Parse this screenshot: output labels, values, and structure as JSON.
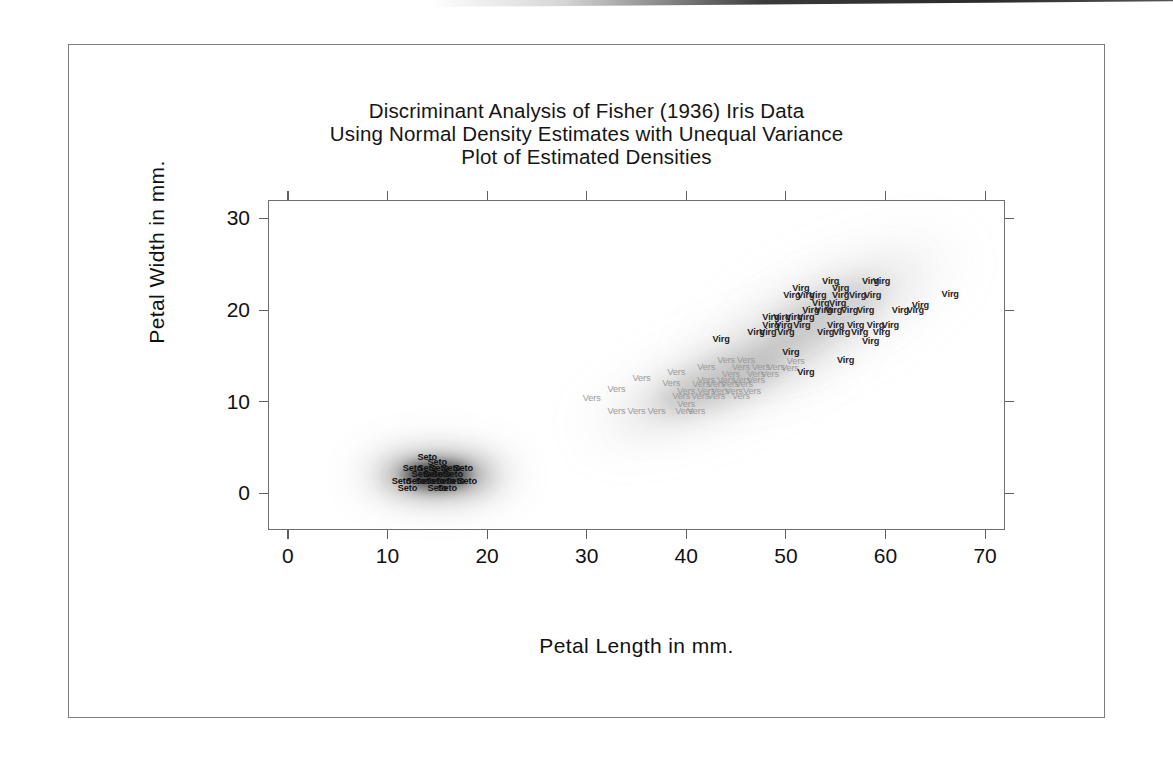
{
  "figure": {
    "title_lines": [
      "Discriminant Analysis of Fisher (1936) Iris Data",
      "Using Normal Density Estimates with Unequal Variance",
      "Plot of Estimated Densities"
    ]
  },
  "chart_data": {
    "type": "scatter",
    "title": "Discriminant Analysis of Fisher (1936) Iris Data Using Normal Density Estimates with Unequal Variance Plot of Estimated Densities",
    "xlabel": "Petal Length in mm.",
    "ylabel": "Petal Width in mm.",
    "xlim": [
      -2,
      72
    ],
    "ylim": [
      -4,
      32
    ],
    "xticks": [
      0,
      10,
      20,
      30,
      40,
      50,
      60,
      70
    ],
    "yticks": [
      0,
      10,
      20,
      30
    ],
    "grid": false,
    "legend": "none",
    "point_label_mode": "species-abbreviation",
    "colors": {
      "setosa": "#111111",
      "versicolor": "#9a9a9a",
      "virginica": "#222222",
      "axis": "#6f6f6f",
      "border": "#7d7d7d",
      "text": "#111111"
    },
    "series": [
      {
        "name": "Setosa",
        "label": "Seto",
        "color": "#111111",
        "points": [
          [
            14,
            4
          ],
          [
            15,
            3.4
          ],
          [
            12.5,
            2.8
          ],
          [
            14,
            2.8
          ],
          [
            15.2,
            2.8
          ],
          [
            16.4,
            2.8
          ],
          [
            17.6,
            2.8
          ],
          [
            13.4,
            2.1
          ],
          [
            14.6,
            2.1
          ],
          [
            15.4,
            2.1
          ],
          [
            16.6,
            2.1
          ],
          [
            11.4,
            1.4
          ],
          [
            12.8,
            1.4
          ],
          [
            13.8,
            1.4
          ],
          [
            14.8,
            1.4
          ],
          [
            15.8,
            1.4
          ],
          [
            16.8,
            1.4
          ],
          [
            18,
            1.4
          ],
          [
            12,
            0.6
          ],
          [
            15,
            0.6
          ],
          [
            16,
            0.6
          ]
        ]
      },
      {
        "name": "Versicolor",
        "label": "Vers",
        "color": "#9a9a9a",
        "points": [
          [
            44,
            14.6
          ],
          [
            46,
            14.6
          ],
          [
            51,
            14.4
          ],
          [
            42,
            13.8
          ],
          [
            45.5,
            13.8
          ],
          [
            47.5,
            13.8
          ],
          [
            49,
            13.8
          ],
          [
            50.4,
            13.7
          ],
          [
            39,
            13.2
          ],
          [
            44.5,
            13.0
          ],
          [
            47,
            13.0
          ],
          [
            48.4,
            13.0
          ],
          [
            35.5,
            12.6
          ],
          [
            42,
            12.4
          ],
          [
            44,
            12.4
          ],
          [
            45.6,
            12.4
          ],
          [
            47,
            12.4
          ],
          [
            38.5,
            12.0
          ],
          [
            41.5,
            11.9
          ],
          [
            43,
            11.9
          ],
          [
            44.4,
            11.9
          ],
          [
            45.8,
            11.9
          ],
          [
            33,
            11.4
          ],
          [
            40,
            11.2
          ],
          [
            42,
            11.2
          ],
          [
            43.4,
            11.2
          ],
          [
            44.8,
            11.2
          ],
          [
            46.6,
            11.2
          ],
          [
            39.5,
            10.6
          ],
          [
            41.4,
            10.6
          ],
          [
            43,
            10.6
          ],
          [
            45.5,
            10.6
          ],
          [
            30.5,
            10.4
          ],
          [
            40,
            9.8
          ],
          [
            33,
            9.0
          ],
          [
            35,
            9.0
          ],
          [
            37,
            9.0
          ],
          [
            39.8,
            9.0
          ],
          [
            41,
            9.0
          ]
        ]
      },
      {
        "name": "Virginica",
        "label": "Virg",
        "color": "#222222",
        "points": [
          [
            54.5,
            23.2
          ],
          [
            58.5,
            23.2
          ],
          [
            59.6,
            23.2
          ],
          [
            51.5,
            22.4
          ],
          [
            55.5,
            22.4
          ],
          [
            50.6,
            21.6
          ],
          [
            52,
            21.6
          ],
          [
            53.2,
            21.6
          ],
          [
            55.5,
            21.6
          ],
          [
            57.2,
            21.6
          ],
          [
            58.7,
            21.6
          ],
          [
            66.5,
            21.8
          ],
          [
            53.5,
            20.8
          ],
          [
            55.2,
            20.8
          ],
          [
            63.5,
            20.6
          ],
          [
            52.5,
            20.0
          ],
          [
            53.8,
            20.0
          ],
          [
            54.8,
            20.0
          ],
          [
            56.4,
            20.0
          ],
          [
            58,
            20.0
          ],
          [
            61.5,
            20.0
          ],
          [
            63,
            20.0
          ],
          [
            48.5,
            19.2
          ],
          [
            49.6,
            19.2
          ],
          [
            50.8,
            19.2
          ],
          [
            52,
            19.2
          ],
          [
            48.5,
            18.4
          ],
          [
            49.8,
            18.4
          ],
          [
            51.6,
            18.4
          ],
          [
            55,
            18.4
          ],
          [
            57,
            18.4
          ],
          [
            59,
            18.4
          ],
          [
            60.5,
            18.4
          ],
          [
            47,
            17.6
          ],
          [
            48.2,
            17.6
          ],
          [
            50,
            17.6
          ],
          [
            54,
            17.6
          ],
          [
            55.6,
            17.6
          ],
          [
            57.4,
            17.6
          ],
          [
            59.6,
            17.6
          ],
          [
            43.5,
            16.8
          ],
          [
            58.5,
            16.6
          ],
          [
            50.5,
            15.4
          ],
          [
            56,
            14.6
          ],
          [
            52,
            13.2
          ]
        ]
      }
    ]
  },
  "axes": {
    "x": {
      "title": "Petal Length in mm.",
      "ticks": [
        "0",
        "10",
        "20",
        "30",
        "40",
        "50",
        "60",
        "70"
      ]
    },
    "y": {
      "title": "Petal Width in mm.",
      "ticks": [
        "30",
        "20",
        "10",
        "0"
      ]
    }
  }
}
